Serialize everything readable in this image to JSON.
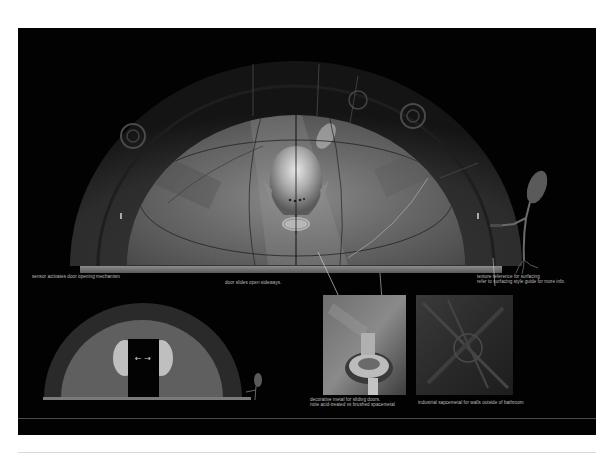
{
  "sheet": {
    "background": "#ffffff",
    "panel_color": "#020202",
    "caption_color": "#bdbdbd"
  },
  "main_illustration": {
    "subject": "domed sliding door with alien skull emblem",
    "icons": [
      "dome-door-icon",
      "skull-emblem-icon",
      "sensor-creature-icon"
    ]
  },
  "small_illustration": {
    "subject": "dome door opening sideways",
    "arrows": "← →"
  },
  "captions": {
    "sensor": "sensor activates door opening mechanism",
    "door_slides": "door slides open sideways.",
    "texture_ref_line1": "texture reference for surfacing",
    "texture_ref_line2": "refer to surfacing style guide for more info.",
    "decorative_line1": "decorative metal for sliding doors.",
    "decorative_line2": "note acid-treated vs brushed spacemetal",
    "industrial": "industrial sapcemetal for walls outside of bathroom"
  },
  "tiles": [
    {
      "name": "decorative-metal-tile",
      "label": "decorative metal"
    },
    {
      "name": "industrial-metal-tile",
      "label": "industrial spacemetal"
    }
  ]
}
